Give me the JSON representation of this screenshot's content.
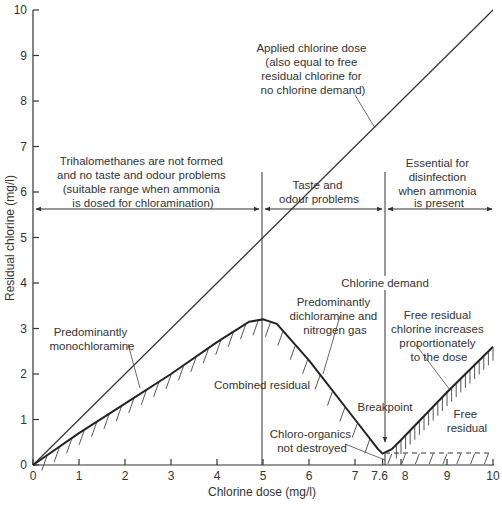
{
  "chart_data": {
    "type": "line",
    "title": "",
    "xlabel": "Chlorine dose (mg/l)",
    "ylabel": "Residual chlorine (mg/l)",
    "xlim": [
      0,
      10
    ],
    "ylim": [
      0,
      10
    ],
    "x_ticks": [
      "0",
      "1",
      "2",
      "3",
      "4",
      "5",
      "6",
      "7",
      "7.6",
      "8",
      "9",
      "10"
    ],
    "y_ticks": [
      "0",
      "1",
      "2",
      "3",
      "4",
      "5",
      "6",
      "7",
      "8",
      "9",
      "10"
    ],
    "grid": false,
    "series": [
      {
        "name": "Applied chlorine dose",
        "x": [
          0,
          10
        ],
        "y": [
          0,
          10
        ]
      },
      {
        "name": "Residual chlorine (combined then free)",
        "x": [
          0,
          1,
          2,
          3,
          4,
          4.7,
          5,
          5.3,
          6,
          7,
          7.5,
          7.6,
          7.8,
          8,
          9,
          10
        ],
        "y": [
          0,
          0.7,
          1.35,
          2.0,
          2.7,
          3.15,
          3.2,
          3.1,
          2.3,
          1.0,
          0.35,
          0.25,
          0.35,
          0.55,
          1.6,
          2.6
        ]
      },
      {
        "name": "Chloro-organics not destroyed (dashed)",
        "x": [
          7.6,
          10
        ],
        "y": [
          0.25,
          0.25
        ]
      }
    ],
    "vertical_markers": [
      {
        "x": 5,
        "label": ""
      },
      {
        "x": 7.6,
        "label": "Chlorine demand"
      }
    ],
    "annotations": [
      {
        "text": "Applied chlorine dose (also equal to free residual chlorine for no chlorine demand)"
      },
      {
        "text": "Trihalomethanes are not formed and no taste and odour problems (suitable range when ammonia is dosed for chloramination)",
        "range": [
          0,
          5
        ]
      },
      {
        "text": "Taste and odour problems",
        "range": [
          5,
          7.6
        ]
      },
      {
        "text": "Essential for disinfection when ammonia is present",
        "range": [
          7.6,
          10
        ]
      },
      {
        "text": "Predominantly monochloramine"
      },
      {
        "text": "Combined residual"
      },
      {
        "text": "Predominantly dichloramine and nitrogen gas"
      },
      {
        "text": "Chlorine demand"
      },
      {
        "text": "Free residual chlorine increases proportionately to the dose"
      },
      {
        "text": "Breakpoint",
        "x": 7.6
      },
      {
        "text": "Chloro-organics not destroyed"
      },
      {
        "text": "Free residual"
      }
    ]
  },
  "labels": {
    "xlabel": "Chlorine dose (mg/l)",
    "ylabel": "Residual chlorine (mg/l)",
    "applied": [
      "Applied chlorine dose",
      "(also equal to free",
      "residual chlorine for",
      "no chlorine demand)"
    ],
    "thm": [
      "Trihalomethanes are not formed",
      "and no taste and odour problems",
      "(suitable range when ammonia",
      "is dosed for chloramination)"
    ],
    "taste": [
      "Taste and",
      "odour problems"
    ],
    "essential": [
      "Essential for",
      "disinfection",
      "when ammonia",
      "is present"
    ],
    "mono": [
      "Predominantly",
      "monochloramine"
    ],
    "combined": "Combined residual",
    "dichlor": [
      "Predominantly",
      "dichloramine and",
      "nitrogen gas"
    ],
    "demand": "Chlorine demand",
    "free_inc": [
      "Free residual",
      "chlorine increases",
      "proportionately",
      "to the dose"
    ],
    "breakpoint": "Breakpoint",
    "chloro": [
      "Chloro-organics",
      "not destroyed"
    ],
    "free_res": [
      "Free",
      "residual"
    ]
  }
}
